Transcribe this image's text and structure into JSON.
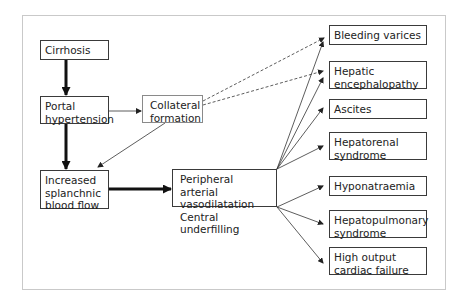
{
  "diagram": {
    "nodes": {
      "cirrhosis": "Cirrhosis",
      "portal_hypertension": [
        "Portal",
        "hypertension"
      ],
      "collateral_formation": [
        "Collateral",
        "formation"
      ],
      "increased_splanchnic_blood_flow": [
        "Increased",
        "splanchnic",
        "blood flow"
      ],
      "peripheral_vasodilatation": [
        "Peripheral arterial",
        "vasodilatation",
        "Central underfilling"
      ],
      "bleeding_varices": "Bleeding varices",
      "hepatic_encephalopathy": [
        "Hepatic",
        "encephalopathy"
      ],
      "ascites": "Ascites",
      "hepatorenal_syndrome": [
        "Hepatorenal",
        "syndrome"
      ],
      "hyponatraemia": "Hyponatraemia",
      "hepatopulmonary_syndrome": [
        "Hepatopulmonary",
        "syndrome"
      ],
      "high_output_cardiac_failure": [
        "High output",
        "cardiac failure"
      ]
    },
    "edges": [
      {
        "from": "Cirrhosis",
        "to": "Portal hypertension",
        "style": "thick"
      },
      {
        "from": "Portal hypertension",
        "to": "Increased splanchnic blood flow",
        "style": "thick"
      },
      {
        "from": "Portal hypertension",
        "to": "Collateral formation",
        "style": "thin"
      },
      {
        "from": "Collateral formation",
        "to": "Increased splanchnic blood flow",
        "style": "thin"
      },
      {
        "from": "Collateral formation",
        "to": "Bleeding varices",
        "style": "dashed"
      },
      {
        "from": "Collateral formation",
        "to": "Hepatic encephalopathy",
        "style": "dashed"
      },
      {
        "from": "Increased splanchnic blood flow",
        "to": "Peripheral arterial vasodilatation / Central underfilling",
        "style": "thick"
      },
      {
        "from": "Peripheral arterial vasodilatation / Central underfilling",
        "to": "Bleeding varices",
        "style": "thin"
      },
      {
        "from": "Peripheral arterial vasodilatation / Central underfilling",
        "to": "Hepatic encephalopathy",
        "style": "thin"
      },
      {
        "from": "Peripheral arterial vasodilatation / Central underfilling",
        "to": "Ascites",
        "style": "thin"
      },
      {
        "from": "Peripheral arterial vasodilatation / Central underfilling",
        "to": "Hepatorenal syndrome",
        "style": "thin"
      },
      {
        "from": "Peripheral arterial vasodilatation / Central underfilling",
        "to": "Hyponatraemia",
        "style": "thin"
      },
      {
        "from": "Peripheral arterial vasodilatation / Central underfilling",
        "to": "Hepatopulmonary syndrome",
        "style": "thin"
      },
      {
        "from": "Peripheral arterial vasodilatation / Central underfilling",
        "to": "High output cardiac failure",
        "style": "thin"
      }
    ]
  }
}
